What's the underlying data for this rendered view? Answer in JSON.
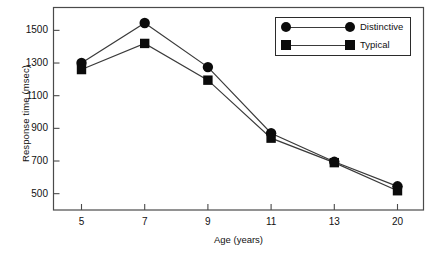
{
  "chart_data": {
    "type": "line",
    "title": "",
    "xlabel": "Age (years)",
    "ylabel": "Response time (msec)",
    "categories": [
      "5",
      "7",
      "9",
      "11",
      "13",
      "20"
    ],
    "xtick_labels": [
      "5",
      "7",
      "9",
      "11",
      "13",
      "20"
    ],
    "ytick_labels": [
      "500",
      "700",
      "900",
      "1100",
      "1300",
      "1500"
    ],
    "yticks": [
      500,
      700,
      900,
      1100,
      1300,
      1500
    ],
    "ylim": [
      400,
      1640
    ],
    "grid": false,
    "legend_position": "top-right",
    "series": [
      {
        "name": "Distinctive",
        "marker": "circle",
        "values": [
          1300,
          1545,
          1275,
          870,
          695,
          545
        ]
      },
      {
        "name": "Typical",
        "marker": "square",
        "values": [
          1260,
          1420,
          1195,
          840,
          690,
          518
        ]
      }
    ],
    "colors": {
      "line": "#3a3a3a",
      "marker": "#0b0b0b",
      "axis": "#4a4a4a",
      "background": "#ffffff",
      "legend_border": "#2b2b2b",
      "text": "#111111"
    }
  },
  "legend": {
    "entries": [
      {
        "label": "Distinctive",
        "marker": "circle"
      },
      {
        "label": "Typical",
        "marker": "square"
      }
    ]
  },
  "axes": {
    "x_title": "Age (years)",
    "y_title": "Response time (msec)"
  }
}
